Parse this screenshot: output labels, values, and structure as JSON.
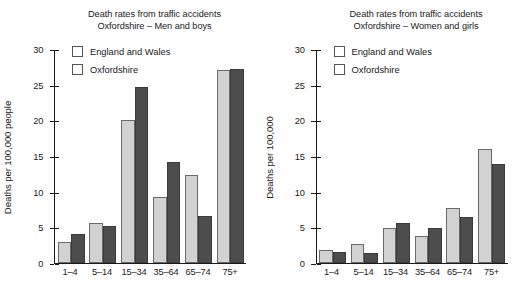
{
  "chart_data": [
    {
      "type": "bar",
      "panel": "left",
      "title": "Death rates from traffic accidents",
      "subtitle": "Oxfordshire – Men and boys",
      "xlabel": "",
      "ylabel": "Deaths per 100,000 people",
      "categories": [
        "1–4",
        "5–14",
        "15–34",
        "35–64",
        "65–74",
        "75+"
      ],
      "series": [
        {
          "name": "England and Wales",
          "color": "#d2d2d2",
          "values": [
            2.9,
            5.5,
            20.0,
            9.2,
            12.3,
            27.0
          ]
        },
        {
          "name": "Oxfordshire",
          "color": "#4d4d4d",
          "values": [
            4.0,
            5.2,
            24.6,
            14.1,
            6.5,
            27.2
          ]
        }
      ],
      "ylim": [
        0,
        30
      ],
      "yticks": [
        0,
        5,
        10,
        15,
        20,
        25,
        30
      ],
      "grid": false,
      "legend_position": "top-left"
    },
    {
      "type": "bar",
      "panel": "right",
      "title": "Death rates from traffic accidents",
      "subtitle": "Oxfordshire – Women and girls",
      "xlabel": "",
      "ylabel": "Deaths per 100,000",
      "categories": [
        "1–4",
        "5–14",
        "15–34",
        "35–64",
        "65–74",
        "75+"
      ],
      "series": [
        {
          "name": "England and Wales",
          "color": "#d2d2d2",
          "values": [
            1.8,
            2.6,
            4.9,
            3.7,
            7.7,
            16.0
          ]
        },
        {
          "name": "Oxfordshire",
          "color": "#4d4d4d",
          "values": [
            1.5,
            1.3,
            5.5,
            4.9,
            6.4,
            13.8
          ]
        }
      ],
      "ylim": [
        0,
        30
      ],
      "yticks": [
        0,
        5,
        10,
        15,
        20,
        25,
        30
      ],
      "grid": false,
      "legend_position": "top-left"
    }
  ]
}
